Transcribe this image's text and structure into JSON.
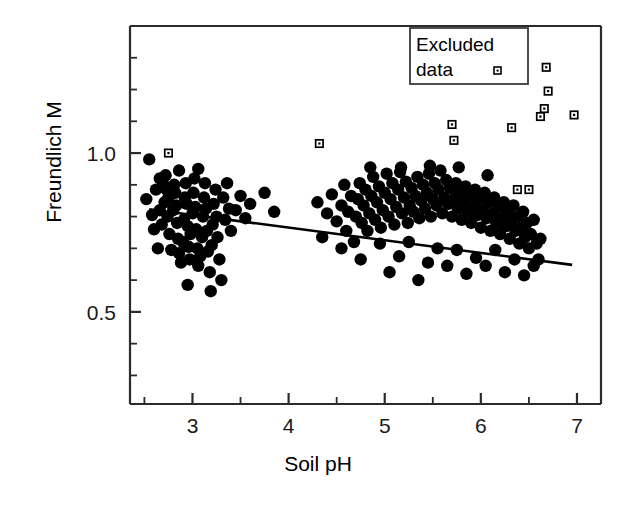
{
  "chart_data": {
    "type": "scatter",
    "title": "",
    "xlabel": "Soil pH",
    "ylabel": "Freundlich M",
    "xlim": [
      2.35,
      7.25
    ],
    "ylim": [
      0.21,
      1.4
    ],
    "xticks": [
      3,
      4,
      5,
      6,
      7
    ],
    "xtick_labels": [
      "3",
      "4",
      "5",
      "6",
      "7"
    ],
    "yticks": [
      0.5,
      1.0
    ],
    "ytick_labels": [
      "0.5",
      "1.0"
    ],
    "minor_tick_step_y": 0.1,
    "grid": false,
    "legend_position": "top-right",
    "legend": [
      {
        "label": "Excluded data",
        "marker": "open-square"
      }
    ],
    "series": [
      {
        "name": "Included data",
        "marker": "filled-circle",
        "color": "#000000",
        "points": [
          [
            2.52,
            0.855
          ],
          [
            2.55,
            0.98
          ],
          [
            2.58,
            0.805
          ],
          [
            2.6,
            0.76
          ],
          [
            2.62,
            0.885
          ],
          [
            2.64,
            0.7
          ],
          [
            2.66,
            0.82
          ],
          [
            2.68,
            0.775
          ],
          [
            2.7,
            0.9
          ],
          [
            2.71,
            0.845
          ],
          [
            2.72,
            0.93
          ],
          [
            2.73,
            0.885
          ],
          [
            2.74,
            0.8
          ],
          [
            2.75,
            0.86
          ],
          [
            2.76,
            0.745
          ],
          [
            2.78,
            0.695
          ],
          [
            2.8,
            0.82
          ],
          [
            2.81,
            0.9
          ],
          [
            2.82,
            0.875
          ],
          [
            2.83,
            0.835
          ],
          [
            2.84,
            0.78
          ],
          [
            2.85,
            0.73
          ],
          [
            2.86,
            0.685
          ],
          [
            2.88,
            0.655
          ],
          [
            2.9,
            0.72
          ],
          [
            2.91,
            0.79
          ],
          [
            2.92,
            0.86
          ],
          [
            2.93,
            0.905
          ],
          [
            2.94,
            0.84
          ],
          [
            2.95,
            0.77
          ],
          [
            2.96,
            0.705
          ],
          [
            2.97,
            0.665
          ],
          [
            2.98,
            0.745
          ],
          [
            3.0,
            0.81
          ],
          [
            3.01,
            0.875
          ],
          [
            3.02,
            0.92
          ],
          [
            3.03,
            0.83
          ],
          [
            3.04,
            0.76
          ],
          [
            3.05,
            0.7
          ],
          [
            3.06,
            0.645
          ],
          [
            3.08,
            0.675
          ],
          [
            3.1,
            0.735
          ],
          [
            3.11,
            0.8
          ],
          [
            3.12,
            0.86
          ],
          [
            3.13,
            0.905
          ],
          [
            3.14,
            0.825
          ],
          [
            3.15,
            0.755
          ],
          [
            3.16,
            0.69
          ],
          [
            3.18,
            0.625
          ],
          [
            3.2,
            0.71
          ],
          [
            3.21,
            0.775
          ],
          [
            3.22,
            0.84
          ],
          [
            3.24,
            0.885
          ],
          [
            3.25,
            0.8
          ],
          [
            3.26,
            0.735
          ],
          [
            3.28,
            0.665
          ],
          [
            3.3,
            0.6
          ],
          [
            3.32,
            0.86
          ],
          [
            3.34,
            0.79
          ],
          [
            3.36,
            0.905
          ],
          [
            3.38,
            0.825
          ],
          [
            3.4,
            0.755
          ],
          [
            3.45,
            0.82
          ],
          [
            3.5,
            0.865
          ],
          [
            3.55,
            0.795
          ],
          [
            3.6,
            0.84
          ],
          [
            3.75,
            0.875
          ],
          [
            3.85,
            0.815
          ],
          [
            4.3,
            0.845
          ],
          [
            4.4,
            0.81
          ],
          [
            4.45,
            0.87
          ],
          [
            4.5,
            0.785
          ],
          [
            4.55,
            0.835
          ],
          [
            4.58,
            0.9
          ],
          [
            4.6,
            0.755
          ],
          [
            4.62,
            0.815
          ],
          [
            4.65,
            0.865
          ],
          [
            4.68,
            0.72
          ],
          [
            4.7,
            0.8
          ],
          [
            4.72,
            0.855
          ],
          [
            4.74,
            0.905
          ],
          [
            4.76,
            0.78
          ],
          [
            4.78,
            0.835
          ],
          [
            4.8,
            0.885
          ],
          [
            4.82,
            0.755
          ],
          [
            4.84,
            0.81
          ],
          [
            4.86,
            0.865
          ],
          [
            4.88,
            0.925
          ],
          [
            4.9,
            0.79
          ],
          [
            4.92,
            0.845
          ],
          [
            4.94,
            0.895
          ],
          [
            4.96,
            0.765
          ],
          [
            4.98,
            0.82
          ],
          [
            5.0,
            0.875
          ],
          [
            5.02,
            0.935
          ],
          [
            5.04,
            0.8
          ],
          [
            5.06,
            0.855
          ],
          [
            5.08,
            0.905
          ],
          [
            5.1,
            0.775
          ],
          [
            5.12,
            0.83
          ],
          [
            5.14,
            0.885
          ],
          [
            5.16,
            0.94
          ],
          [
            5.18,
            0.81
          ],
          [
            5.2,
            0.86
          ],
          [
            5.22,
            0.91
          ],
          [
            5.24,
            0.78
          ],
          [
            5.26,
            0.835
          ],
          [
            5.28,
            0.89
          ],
          [
            5.3,
            0.815
          ],
          [
            5.32,
            0.865
          ],
          [
            5.34,
            0.925
          ],
          [
            5.36,
            0.795
          ],
          [
            5.38,
            0.85
          ],
          [
            5.4,
            0.9
          ],
          [
            5.42,
            0.825
          ],
          [
            5.44,
            0.875
          ],
          [
            5.46,
            0.935
          ],
          [
            5.48,
            0.8
          ],
          [
            5.5,
            0.855
          ],
          [
            5.52,
            0.905
          ],
          [
            5.54,
            0.835
          ],
          [
            5.56,
            0.885
          ],
          [
            5.58,
            0.945
          ],
          [
            5.6,
            0.81
          ],
          [
            5.62,
            0.86
          ],
          [
            5.64,
            0.915
          ],
          [
            5.66,
            0.84
          ],
          [
            5.68,
            0.89
          ],
          [
            5.7,
            0.8
          ],
          [
            5.72,
            0.855
          ],
          [
            5.74,
            0.905
          ],
          [
            5.76,
            0.825
          ],
          [
            5.78,
            0.875
          ],
          [
            5.8,
            0.79
          ],
          [
            5.82,
            0.845
          ],
          [
            5.84,
            0.895
          ],
          [
            5.86,
            0.815
          ],
          [
            5.88,
            0.865
          ],
          [
            5.9,
            0.78
          ],
          [
            5.92,
            0.83
          ],
          [
            5.94,
            0.885
          ],
          [
            5.96,
            0.805
          ],
          [
            5.98,
            0.855
          ],
          [
            6.0,
            0.765
          ],
          [
            6.02,
            0.82
          ],
          [
            6.04,
            0.875
          ],
          [
            6.06,
            0.795
          ],
          [
            6.08,
            0.845
          ],
          [
            6.1,
            0.755
          ],
          [
            6.12,
            0.81
          ],
          [
            6.14,
            0.86
          ],
          [
            6.16,
            0.78
          ],
          [
            6.18,
            0.83
          ],
          [
            6.2,
            0.745
          ],
          [
            6.22,
            0.795
          ],
          [
            6.24,
            0.845
          ],
          [
            6.26,
            0.77
          ],
          [
            6.28,
            0.815
          ],
          [
            6.3,
            0.73
          ],
          [
            6.32,
            0.785
          ],
          [
            6.34,
            0.835
          ],
          [
            6.36,
            0.755
          ],
          [
            6.38,
            0.8
          ],
          [
            6.4,
            0.715
          ],
          [
            6.42,
            0.765
          ],
          [
            6.44,
            0.815
          ],
          [
            6.46,
            0.735
          ],
          [
            6.48,
            0.78
          ],
          [
            6.5,
            0.7
          ],
          [
            6.52,
            0.745
          ],
          [
            6.55,
            0.79
          ],
          [
            6.58,
            0.715
          ],
          [
            6.6,
            0.665
          ],
          [
            6.62,
            0.73
          ],
          [
            4.35,
            0.735
          ],
          [
            4.55,
            0.7
          ],
          [
            4.75,
            0.665
          ],
          [
            4.95,
            0.715
          ],
          [
            5.05,
            0.625
          ],
          [
            5.15,
            0.675
          ],
          [
            5.25,
            0.72
          ],
          [
            5.35,
            0.6
          ],
          [
            5.45,
            0.655
          ],
          [
            5.55,
            0.7
          ],
          [
            5.65,
            0.645
          ],
          [
            5.75,
            0.695
          ],
          [
            5.85,
            0.62
          ],
          [
            5.95,
            0.67
          ],
          [
            6.05,
            0.645
          ],
          [
            6.15,
            0.695
          ],
          [
            6.25,
            0.625
          ],
          [
            6.35,
            0.665
          ],
          [
            6.45,
            0.615
          ],
          [
            6.55,
            0.645
          ],
          [
            2.66,
            0.92
          ],
          [
            2.86,
            0.945
          ],
          [
            3.06,
            0.95
          ],
          [
            3.19,
            0.565
          ],
          [
            2.95,
            0.585
          ],
          [
            4.85,
            0.955
          ],
          [
            5.17,
            0.955
          ],
          [
            5.47,
            0.96
          ],
          [
            5.77,
            0.955
          ],
          [
            6.07,
            0.93
          ]
        ]
      },
      {
        "name": "Excluded data",
        "marker": "open-square",
        "color": "#000000",
        "points": [
          [
            2.75,
            1.0
          ],
          [
            4.32,
            1.03
          ],
          [
            5.7,
            1.09
          ],
          [
            5.72,
            1.04
          ],
          [
            6.32,
            1.08
          ],
          [
            6.38,
            0.885
          ],
          [
            6.5,
            0.885
          ],
          [
            6.62,
            1.115
          ],
          [
            6.66,
            1.14
          ],
          [
            6.68,
            1.27
          ],
          [
            6.7,
            1.195
          ],
          [
            6.97,
            1.12
          ]
        ]
      }
    ],
    "regression_line": {
      "label": "fit",
      "x_start": 2.55,
      "y_start": 0.823,
      "x_end": 6.95,
      "y_end": 0.648,
      "color": "#000000"
    }
  },
  "legend_box": {
    "line1": "Excluded",
    "line2": "data"
  }
}
